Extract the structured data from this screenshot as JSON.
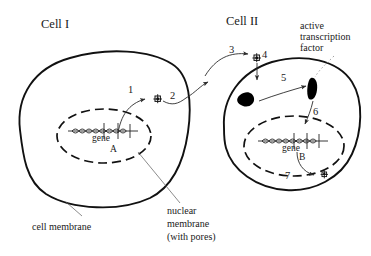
{
  "figure": {
    "kind": "cell-signaling-diagram",
    "background": "#ffffff",
    "ink": "#111111"
  },
  "titles": {
    "cell_one": "Cell I",
    "cell_two": "Cell II"
  },
  "cell_one": {
    "gene_label": "gene",
    "gene_letter": "A",
    "steps": [
      {
        "id": "1",
        "label": "1"
      },
      {
        "id": "2",
        "label": "2"
      }
    ]
  },
  "cell_two": {
    "gene_label": "gene",
    "gene_letter": "B",
    "steps": [
      {
        "id": "3",
        "label": "3"
      },
      {
        "id": "4",
        "label": "4"
      },
      {
        "id": "5",
        "label": "5"
      },
      {
        "id": "6",
        "label": "6"
      },
      {
        "id": "7",
        "label": "7"
      }
    ]
  },
  "annotations": {
    "active_tf_line1": "active",
    "active_tf_line2": "transcription",
    "active_tf_line3": "factor",
    "cell_membrane": "cell membrane",
    "nuclear_membrane_line1": "nuclear",
    "nuclear_membrane_line2": "membrane",
    "nuclear_membrane_line3": "(with pores)"
  }
}
